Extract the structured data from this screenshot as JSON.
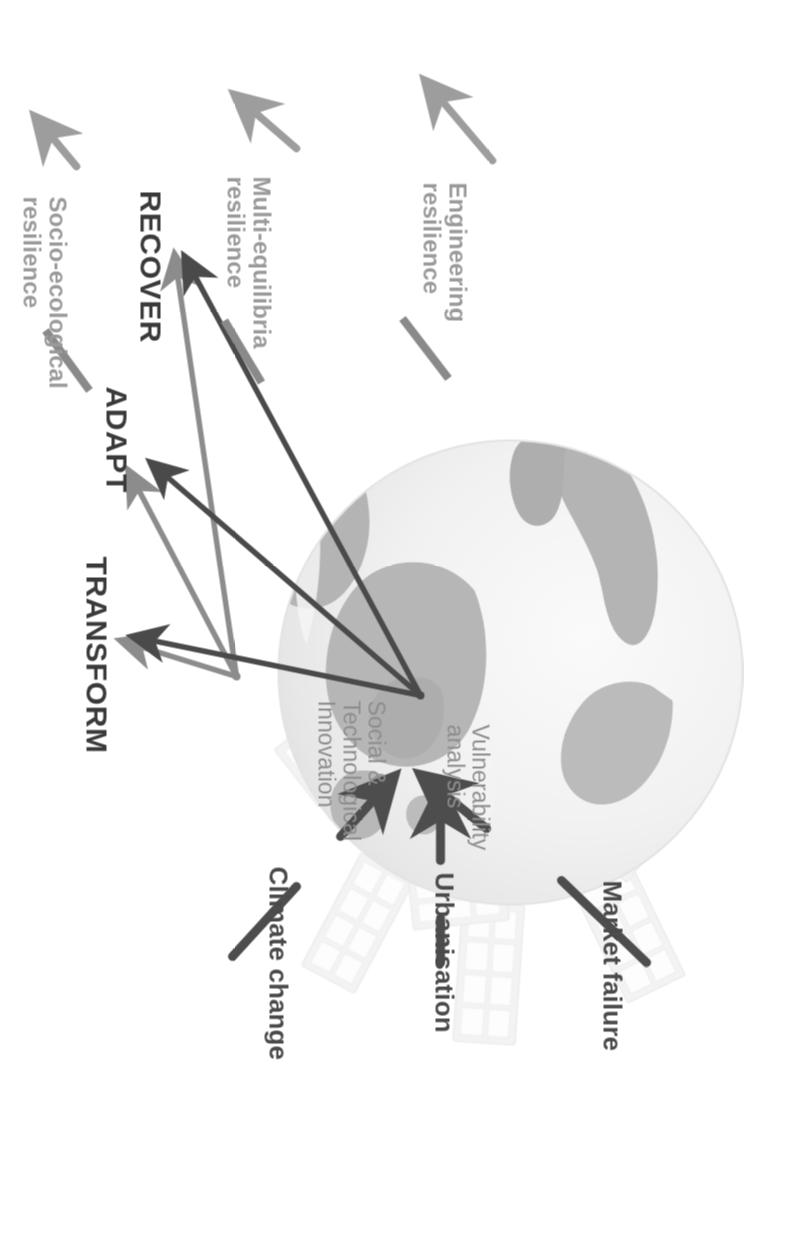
{
  "figure": {
    "title_present": false,
    "orientation": "rotated-90-clockwise",
    "background_color": "#ffffff"
  },
  "palette": {
    "driver_text": "#4a4a4a",
    "driver_arrow": "#4d4d4d",
    "mechanism_text": "#8d8d8d",
    "outcome_text": "#3a3a3a",
    "resilience_text": "#9a9a9a",
    "leader_line": "#8a8a8a",
    "globe_ocean": "#efefef",
    "globe_land": "#b9b9b9",
    "globe_land_dark": "#a5a5a5",
    "solar_panel": "#e6e6e6",
    "hub_light_arrow": "#8c8c8c",
    "hub_dark_arrow": "#4a4a4a"
  },
  "drivers": [
    {
      "id": "market-failure",
      "label": "Market failure",
      "arrow": "angled-down-right"
    },
    {
      "id": "urbanisation",
      "label": "Urbanisation",
      "arrow": "straight-down"
    },
    {
      "id": "climate-change",
      "label": "Climate change",
      "arrow": "angled-down-left"
    }
  ],
  "mechanisms": [
    {
      "id": "social-technological-innovation",
      "label": "Social &\nTechnological\nInnovation",
      "hub": "left",
      "arrow_color": "#8c8c8c"
    },
    {
      "id": "vulnerability-analysis",
      "label": "Vulnerability\nanalysis",
      "hub": "right",
      "arrow_color": "#4a4a4a"
    }
  ],
  "outcomes": [
    {
      "id": "transform",
      "label": "TRANSFORM"
    },
    {
      "id": "adapt",
      "label": "ADAPT"
    },
    {
      "id": "recover",
      "label": "RECOVER"
    }
  ],
  "resilience_types": [
    {
      "id": "socio-ecological-resilience",
      "label": "Socio-ecological\nresilience",
      "linked_outcome": "TRANSFORM"
    },
    {
      "id": "multi-equilibria-resilience",
      "label": "Multi-equilibria\nresilience",
      "linked_outcome": "ADAPT"
    },
    {
      "id": "engineering-resilience",
      "label": "Engineering\nresilience",
      "linked_outcome": "RECOVER"
    }
  ],
  "imagery": {
    "globe": "earth-globe-graphic",
    "solar_panels": "solar-panel-array-graphic"
  }
}
